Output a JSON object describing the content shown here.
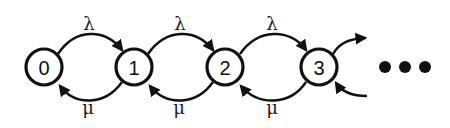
{
  "diagram": {
    "type": "birth-death markov chain",
    "states": [
      {
        "label": "0",
        "cx": 44,
        "cy": 67
      },
      {
        "label": "1",
        "cx": 134,
        "cy": 67
      },
      {
        "label": "2",
        "cx": 225,
        "cy": 67
      },
      {
        "label": "3",
        "cx": 319,
        "cy": 67
      }
    ],
    "forward_rate_label": "λ",
    "backward_rate_label": "μ",
    "transitions": [
      {
        "from": "0",
        "to": "1",
        "rate": "λ"
      },
      {
        "from": "1",
        "to": "0",
        "rate": "μ"
      },
      {
        "from": "1",
        "to": "2",
        "rate": "λ"
      },
      {
        "from": "2",
        "to": "1",
        "rate": "μ"
      },
      {
        "from": "2",
        "to": "3",
        "rate": "λ"
      },
      {
        "from": "3",
        "to": "2",
        "rate": "μ"
      }
    ],
    "continuation": "•••",
    "colors": {
      "stroke": "#111111",
      "background": "#ffffff"
    }
  },
  "labels": {
    "lambda_01": "λ",
    "lambda_12": "λ",
    "lambda_23": "λ",
    "mu_10": "μ",
    "mu_21": "μ",
    "mu_32": "μ",
    "state_0": "0",
    "state_1": "1",
    "state_2": "2",
    "state_3": "3"
  }
}
